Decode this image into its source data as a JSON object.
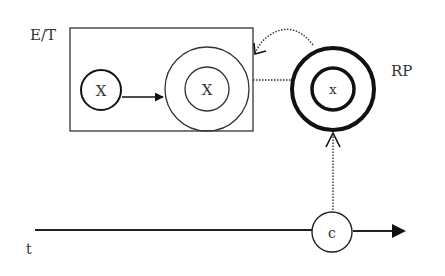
{
  "diagram": {
    "labels": {
      "box": "E/T",
      "rp": "RP",
      "timeline": "t"
    },
    "nodes": {
      "x_left": "X",
      "x_mid": "X",
      "x_rp": "x",
      "c": "c"
    },
    "colors": {
      "stroke": "#1a1a1a",
      "text": "#333333",
      "background": "#ffffff"
    }
  }
}
